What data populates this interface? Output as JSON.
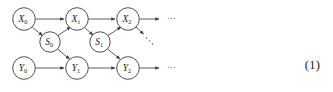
{
  "figure": {
    "type": "graphical-model-diagram",
    "equation_number": "(1)",
    "nodes": [
      {
        "id": "X0",
        "base": "X",
        "subscript": "0",
        "cx": 24,
        "cy": 19,
        "r": 11,
        "row": "X"
      },
      {
        "id": "X1",
        "base": "X",
        "subscript": "1",
        "cx": 77,
        "cy": 19,
        "r": 11,
        "row": "X"
      },
      {
        "id": "X2",
        "base": "X",
        "subscript": "2",
        "cx": 128,
        "cy": 19,
        "r": 11,
        "row": "X"
      },
      {
        "id": "S0",
        "base": "S",
        "subscript": "0",
        "cx": 50,
        "cy": 42,
        "r": 10,
        "row": "S"
      },
      {
        "id": "S1",
        "base": "S",
        "subscript": "1",
        "cx": 100,
        "cy": 42,
        "r": 10,
        "row": "S"
      },
      {
        "id": "Y0",
        "base": "Y",
        "subscript": "0",
        "cx": 24,
        "cy": 68,
        "r": 11,
        "row": "Y"
      },
      {
        "id": "Y1",
        "base": "Y",
        "subscript": "1",
        "cx": 77,
        "cy": 68,
        "r": 11,
        "row": "Y"
      },
      {
        "id": "Y2",
        "base": "Y",
        "subscript": "2",
        "cx": 128,
        "cy": 68,
        "r": 11,
        "row": "Y"
      }
    ],
    "edges": [
      {
        "id": "X0-X1",
        "from": "X0",
        "to": "X1",
        "kind": "solid-arrow"
      },
      {
        "id": "X1-X2",
        "from": "X1",
        "to": "X2",
        "kind": "solid-arrow"
      },
      {
        "id": "X0-S0",
        "from": "X0",
        "to": "S0",
        "kind": "solid-arrow"
      },
      {
        "id": "S0-X1",
        "from": "S0",
        "to": "X1",
        "kind": "solid-arrow"
      },
      {
        "id": "X1-S1",
        "from": "X1",
        "to": "S1",
        "kind": "solid-arrow"
      },
      {
        "id": "S1-X2",
        "from": "S1",
        "to": "X2",
        "kind": "solid-arrow"
      },
      {
        "id": "S0-Y1",
        "from": "S0",
        "to": "Y1",
        "kind": "solid-arrow"
      },
      {
        "id": "S1-Y2",
        "from": "S1",
        "to": "Y2",
        "kind": "solid-arrow"
      },
      {
        "id": "Y0-Y1",
        "from": "Y0",
        "to": "Y1",
        "kind": "solid-arrow"
      },
      {
        "id": "Y1-Y2",
        "from": "Y1",
        "to": "Y2",
        "kind": "solid-arrow"
      },
      {
        "id": "X2-next",
        "from": "X2",
        "to": "continuation",
        "kind": "solid-arrow-stub"
      },
      {
        "id": "Y2-next",
        "from": "Y2",
        "to": "continuation",
        "kind": "solid-arrow-stub"
      },
      {
        "id": "X2-diagonal",
        "from": "X2",
        "to": "continuation-diagonal",
        "kind": "dotted-diagonal"
      }
    ],
    "continuations": [
      {
        "id": "x-row-ellipsis",
        "label": "⋯",
        "x": 174,
        "y": 22
      },
      {
        "id": "y-row-ellipsis",
        "label": "⋯",
        "x": 174,
        "y": 71
      },
      {
        "id": "diagonal-ellipsis",
        "label": "⋰",
        "x": 150,
        "y": 44
      }
    ],
    "colors": {
      "node_stroke": "#3c3c3c",
      "node_fill": "#ffffff",
      "edge": "#4a4a4a",
      "text": "#1a1a1a",
      "background": "#ffffff"
    }
  }
}
